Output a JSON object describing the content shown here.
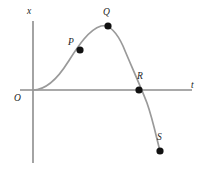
{
  "figure": {
    "title": "",
    "background_color": "#ffffff",
    "axis_color": "#8d8d8d",
    "curve_color": "#9a9a9a",
    "point_color": "#111111"
  },
  "chart_data": {
    "type": "line",
    "title": "",
    "xlabel": "t",
    "ylabel": "x",
    "grid": false,
    "legend": null,
    "origin_label": "O",
    "axes": {
      "vertical": {
        "label": "x",
        "x": 33,
        "y_top": 21,
        "y_bottom": 163
      },
      "horizontal": {
        "label": "t",
        "y": 90,
        "x_left": 20,
        "x_right": 192
      }
    },
    "curve": {
      "description": "Displacement x versus time t: rises from origin, peaks at Q, falls crossing the t-axis at R, continues down to S",
      "path": "M 33 90 C 46 90 58 78 68 62 C 77 48 88 30 101 26 C 110 24 117 33 123 46 C 130 63 140 85 147 103 C 153 120 157 140 160 151",
      "start": {
        "x": 33,
        "y": 90
      },
      "end": {
        "x": 160,
        "y": 151
      }
    },
    "points": [
      {
        "label": "P",
        "x": 80,
        "y": 50,
        "role": "rising-segment",
        "radius": 3.6
      },
      {
        "label": "Q",
        "x": 108,
        "y": 26,
        "role": "maximum",
        "radius": 3.6
      },
      {
        "label": "R",
        "x": 139,
        "y": 90,
        "role": "t-axis-crossing",
        "radius": 3.6
      },
      {
        "label": "S",
        "x": 160,
        "y": 151,
        "role": "minimum-endpoint",
        "radius": 3.6
      }
    ]
  }
}
